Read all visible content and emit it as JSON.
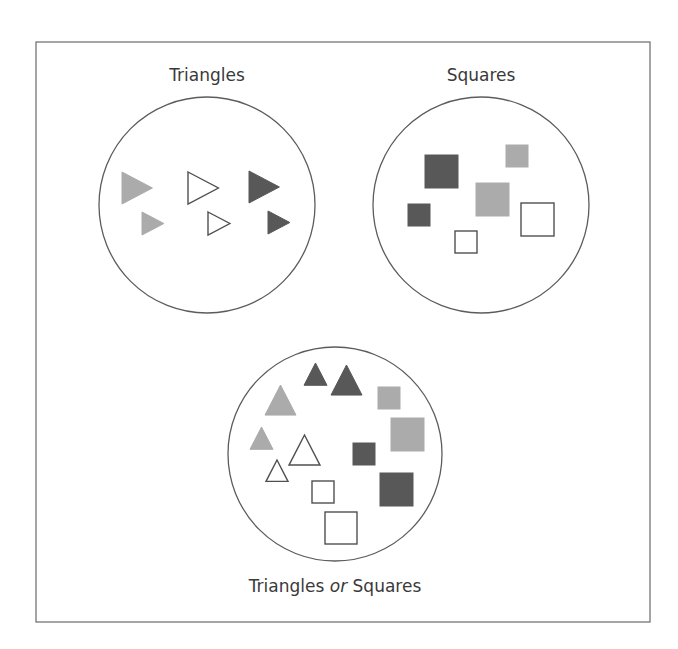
{
  "diagram": {
    "colors": {
      "dark": "#585858",
      "light": "#ababab",
      "open_stroke": "#505050",
      "frame": "#6a6a6a",
      "text": "#3a3a3a"
    },
    "frame": {
      "x": 36,
      "y": 42,
      "width": 614,
      "height": 580
    },
    "sets": [
      {
        "id": "triangles",
        "label": "Triangles",
        "label_pos": {
          "x": 207,
          "y": 81
        },
        "circle": {
          "cx": 207,
          "cy": 205,
          "r": 108
        },
        "shapes": [
          {
            "kind": "triangle-right",
            "fill": "light",
            "x": 122,
            "y": 172,
            "size": 32
          },
          {
            "kind": "triangle-right",
            "fill": "open",
            "x": 188,
            "y": 172,
            "size": 32
          },
          {
            "kind": "triangle-right",
            "fill": "dark",
            "x": 249,
            "y": 171,
            "size": 32
          },
          {
            "kind": "triangle-right",
            "fill": "light",
            "x": 142,
            "y": 212,
            "size": 23
          },
          {
            "kind": "triangle-right",
            "fill": "open",
            "x": 208,
            "y": 212,
            "size": 23
          },
          {
            "kind": "triangle-right",
            "fill": "dark",
            "x": 268,
            "y": 211,
            "size": 23
          }
        ]
      },
      {
        "id": "squares",
        "label": "Squares",
        "label_pos": {
          "x": 481,
          "y": 81
        },
        "circle": {
          "cx": 481,
          "cy": 205,
          "r": 108
        },
        "shapes": [
          {
            "kind": "square",
            "fill": "dark",
            "x": 425,
            "y": 155,
            "size": 33
          },
          {
            "kind": "square",
            "fill": "light",
            "x": 506,
            "y": 145,
            "size": 22
          },
          {
            "kind": "square",
            "fill": "light",
            "x": 476,
            "y": 183,
            "size": 33
          },
          {
            "kind": "square",
            "fill": "dark",
            "x": 408,
            "y": 204,
            "size": 22
          },
          {
            "kind": "square",
            "fill": "open",
            "x": 521,
            "y": 203,
            "size": 33
          },
          {
            "kind": "square",
            "fill": "open",
            "x": 455,
            "y": 231,
            "size": 22
          }
        ]
      },
      {
        "id": "triangles-or-squares",
        "label_parts": [
          "Triangles ",
          "or",
          " Squares"
        ],
        "label_pos": {
          "x": 335,
          "y": 592
        },
        "circle": {
          "cx": 335,
          "cy": 454,
          "r": 107
        },
        "shapes": [
          {
            "kind": "triangle-up",
            "fill": "dark",
            "x": 304,
            "y": 363,
            "size": 23
          },
          {
            "kind": "triangle-up",
            "fill": "dark",
            "x": 331,
            "y": 365,
            "size": 31
          },
          {
            "kind": "triangle-up",
            "fill": "light",
            "x": 265,
            "y": 385,
            "size": 31
          },
          {
            "kind": "triangle-up",
            "fill": "light",
            "x": 250,
            "y": 427,
            "size": 23
          },
          {
            "kind": "triangle-up",
            "fill": "open",
            "x": 289,
            "y": 435,
            "size": 31
          },
          {
            "kind": "triangle-up",
            "fill": "open",
            "x": 266,
            "y": 460,
            "size": 22
          },
          {
            "kind": "square",
            "fill": "light",
            "x": 378,
            "y": 387,
            "size": 22
          },
          {
            "kind": "square",
            "fill": "light",
            "x": 391,
            "y": 418,
            "size": 33
          },
          {
            "kind": "square",
            "fill": "dark",
            "x": 353,
            "y": 443,
            "size": 22
          },
          {
            "kind": "square",
            "fill": "dark",
            "x": 380,
            "y": 473,
            "size": 33
          },
          {
            "kind": "square",
            "fill": "open",
            "x": 312,
            "y": 481,
            "size": 22
          },
          {
            "kind": "square",
            "fill": "open",
            "x": 325,
            "y": 512,
            "size": 32
          }
        ]
      }
    ]
  }
}
